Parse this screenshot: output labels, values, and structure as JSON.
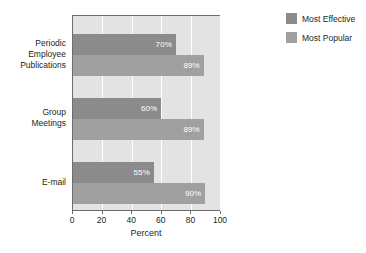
{
  "chart_data": {
    "type": "bar",
    "orientation": "horizontal",
    "title": "",
    "xlabel": "Percent",
    "ylabel": "",
    "xlim": [
      0,
      100
    ],
    "xticks": [
      0,
      20,
      40,
      60,
      80,
      100
    ],
    "xtick_labels": [
      "0",
      "20",
      "40",
      "60",
      "80",
      "100"
    ],
    "grid": "vertical-white-gridlines",
    "legend_position": "right",
    "categories": [
      "Periodic Employee Publications",
      "Group Meetings",
      "E-mail"
    ],
    "category_label_lines": [
      [
        "Periodic",
        "Employee",
        "Publications"
      ],
      [
        "Group",
        "Meetings"
      ],
      [
        "E-mail"
      ]
    ],
    "series": [
      {
        "name": "Most Effective",
        "color": "#8b8b8b",
        "values": [
          70,
          60,
          55
        ],
        "value_labels": [
          "70%",
          "60%",
          "55%"
        ]
      },
      {
        "name": "Most Popular",
        "color": "#a0a0a0",
        "values": [
          89,
          89,
          90
        ],
        "value_labels": [
          "89%",
          "89%",
          "90%"
        ]
      }
    ]
  },
  "legend": {
    "items": [
      {
        "label": "Most Effective",
        "color": "#8b8b8b"
      },
      {
        "label": "Most Popular",
        "color": "#a0a0a0"
      }
    ]
  },
  "axis": {
    "x_title": "Percent"
  },
  "colors": {
    "plot_background": "#e3e3e3",
    "gridline": "#ffffff",
    "axis_line": "#6d6d6d",
    "series_effective": "#8b8b8b",
    "series_popular": "#a0a0a0",
    "value_label": "#ffffff",
    "text": "#231f20"
  }
}
